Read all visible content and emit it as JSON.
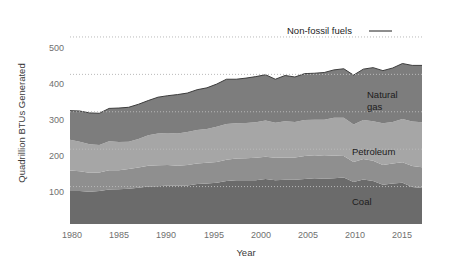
{
  "chart_data": {
    "type": "area",
    "stacked": true,
    "title": "",
    "subtitle": "",
    "xlabel": "Year",
    "ylabel": "Quadrillion BTUs Generated",
    "xlim": [
      1980,
      2016
    ],
    "ylim": [
      0,
      540
    ],
    "xticks": [
      1980,
      1985,
      1990,
      1995,
      2000,
      2005,
      2010,
      2015
    ],
    "xticklabels": [
      "1980",
      "1985",
      "1990",
      "1995",
      "2000",
      "2005",
      "2010",
      "2015"
    ],
    "yticks": [
      100,
      200,
      300,
      400,
      500
    ],
    "yticklabels": [
      "100",
      "200",
      "300",
      "400",
      "500"
    ],
    "grid": "horizontal-dotted",
    "legend": "inline-labels",
    "x": [
      1980,
      1981,
      1982,
      1983,
      1984,
      1985,
      1986,
      1987,
      1988,
      1989,
      1990,
      1991,
      1992,
      1993,
      1994,
      1995,
      1996,
      1997,
      1998,
      1999,
      2000,
      2001,
      2002,
      2003,
      2004,
      2005,
      2006,
      2007,
      2008,
      2009,
      2010,
      2011,
      2012,
      2013,
      2014,
      2015,
      2016
    ],
    "series": [
      {
        "name": "Coal",
        "color": "#6b6b6b",
        "values": [
          88,
          88,
          86,
          88,
          92,
          93,
          94,
          97,
          100,
          101,
          103,
          102,
          103,
          107,
          108,
          110,
          115,
          117,
          117,
          117,
          120,
          117,
          118,
          118,
          120,
          122,
          121,
          122,
          124,
          112,
          119,
          115,
          105,
          108,
          110,
          99,
          96
        ]
      },
      {
        "name": "Petroleum",
        "color": "#8f8f8f",
        "values": [
          55,
          53,
          51,
          50,
          52,
          51,
          53,
          54,
          56,
          56,
          55,
          54,
          55,
          55,
          56,
          56,
          57,
          58,
          59,
          60,
          60,
          60,
          60,
          60,
          62,
          62,
          61,
          61,
          58,
          54,
          55,
          54,
          53,
          54,
          55,
          56,
          56
        ]
      },
      {
        "name": "Natural gas",
        "color": "#a6a6a6",
        "values": [
          82,
          79,
          76,
          73,
          77,
          75,
          73,
          76,
          81,
          85,
          85,
          86,
          88,
          89,
          90,
          94,
          95,
          94,
          94,
          95,
          97,
          94,
          97,
          95,
          96,
          95,
          97,
          101,
          102,
          100,
          104,
          106,
          111,
          111,
          116,
          119,
          120
        ]
      },
      {
        "name": "Non-fossil fuels",
        "color": "#7d7d7d",
        "values": [
          78,
          82,
          84,
          85,
          88,
          91,
          92,
          93,
          93,
          97,
          100,
          104,
          104,
          108,
          110,
          114,
          120,
          118,
          120,
          122,
          122,
          116,
          122,
          120,
          124,
          124,
          126,
          128,
          131,
          132,
          136,
          143,
          141,
          144,
          148,
          150,
          152
        ]
      }
    ],
    "annotations": [
      {
        "text": "Non-fossil fuels",
        "kind": "callout-with-leader"
      },
      {
        "text": "Natural\ngas",
        "kind": "inline"
      },
      {
        "text": "Petroleum",
        "kind": "inline"
      },
      {
        "text": "Coal",
        "kind": "inline"
      }
    ]
  },
  "axes": {
    "y_title": "Quadrillion BTUs Generated",
    "x_title": "Year",
    "y_ticks": [
      "500",
      "400",
      "300",
      "200",
      "100"
    ],
    "x_ticks": [
      "1980",
      "1985",
      "1990",
      "1995",
      "2000",
      "2005",
      "2010",
      "2015"
    ]
  },
  "labels": {
    "non_fossil": "Non-fossil fuels",
    "natural_gas_line1": "Natural",
    "natural_gas_line2": "gas",
    "petroleum": "Petroleum",
    "coal": "Coal"
  },
  "colors": {
    "coal": "#6b6b6b",
    "petroleum": "#8f8f8f",
    "natural_gas": "#a6a6a6",
    "non_fossil": "#7d7d7d",
    "grid": "#b9b9b9",
    "tick_text": "#6f6f6f",
    "axis_title": "#3a3a3a",
    "background": "#ffffff"
  }
}
